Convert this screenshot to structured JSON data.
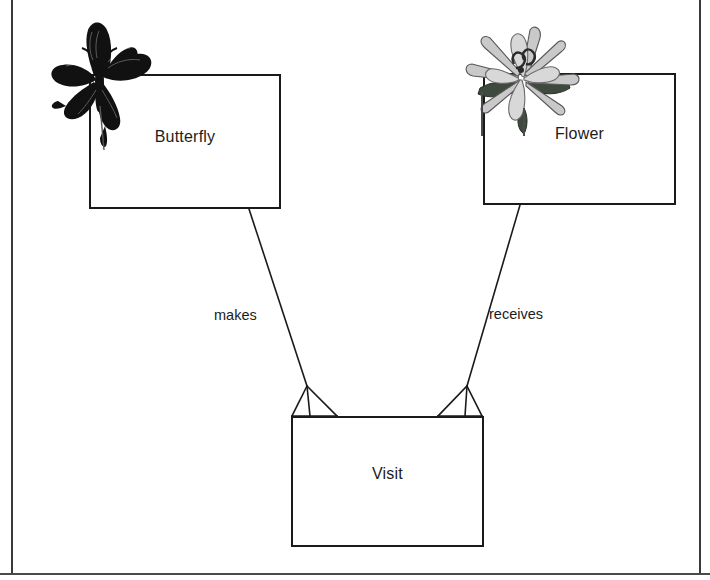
{
  "diagram": {
    "type": "entity-relationship-diagram",
    "notation": "crows-foot",
    "background_color": "#ffffff",
    "line_color": "#1a1a1a",
    "text_color": "#1c1c1c",
    "entities": [
      {
        "id": "butterfly",
        "label": "Butterfly",
        "icon": "butterfly-icon",
        "icon_color": "#111111",
        "box": {
          "x": 89,
          "y": 74,
          "width": 192,
          "height": 135
        }
      },
      {
        "id": "flower",
        "label": "Flower",
        "icon": "flower-icon",
        "icon_color": "#b0b0b0",
        "box": {
          "x": 483,
          "y": 73,
          "width": 193,
          "height": 132
        }
      },
      {
        "id": "visit",
        "label": "Visit",
        "icon": null,
        "box": {
          "x": 291,
          "y": 416,
          "width": 193,
          "height": 131
        }
      }
    ],
    "relationships": [
      {
        "id": "makes",
        "label": "makes",
        "from": "butterfly",
        "to": "visit",
        "to_cardinality": "many",
        "label_position": {
          "x": 214,
          "y": 307
        }
      },
      {
        "id": "receives",
        "label": "receives",
        "from": "flower",
        "to": "visit",
        "to_cardinality": "many",
        "label_position": {
          "x": 489,
          "y": 306
        }
      }
    ]
  }
}
